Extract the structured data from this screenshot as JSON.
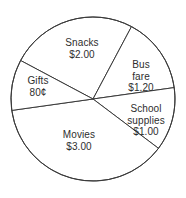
{
  "chart_data": {
    "type": "pie",
    "title": "",
    "subtitle": "",
    "xlabel": "",
    "ylabel": "",
    "legend_position": "none",
    "grid": false,
    "units": "dollars",
    "total": 8.0,
    "total_display": "$8.00",
    "categories": [
      "Snacks",
      "Bus fare",
      "School supplies",
      "Movies",
      "Gifts"
    ],
    "values": [
      2.0,
      1.2,
      1.0,
      3.0,
      0.8
    ],
    "value_labels": [
      "$2.00",
      "$1.20",
      "$1.00",
      "$3.00",
      "80¢"
    ],
    "slices": [
      {
        "name": "Snacks",
        "value": 2.0,
        "value_label": "$2.00",
        "percent": 25.0,
        "angle_deg": 90,
        "start_deg": -152,
        "end_deg": -62,
        "label_x": 82,
        "label_y": 48
      },
      {
        "name": "Bus fare",
        "value": 1.2,
        "value_label": "$1.20",
        "percent": 15.0,
        "angle_deg": 54,
        "start_deg": -62,
        "end_deg": -8,
        "label_x": 141,
        "label_y": 76
      },
      {
        "name": "School supplies",
        "value": 1.0,
        "value_label": "$1.00",
        "percent": 12.5,
        "angle_deg": 45,
        "start_deg": -8,
        "end_deg": 37,
        "label_x": 146,
        "label_y": 120
      },
      {
        "name": "Movies",
        "value": 3.0,
        "value_label": "$3.00",
        "percent": 37.5,
        "angle_deg": 135,
        "start_deg": 37,
        "end_deg": 172,
        "label_x": 79,
        "label_y": 140
      },
      {
        "name": "Gifts",
        "value": 0.8,
        "value_label": "80¢",
        "percent": 10.0,
        "angle_deg": 36,
        "start_deg": 172,
        "end_deg": 208,
        "label_x": 38,
        "label_y": 86
      }
    ],
    "geometry": {
      "center_x": 93,
      "center_y": 99,
      "radius": 82
    }
  }
}
